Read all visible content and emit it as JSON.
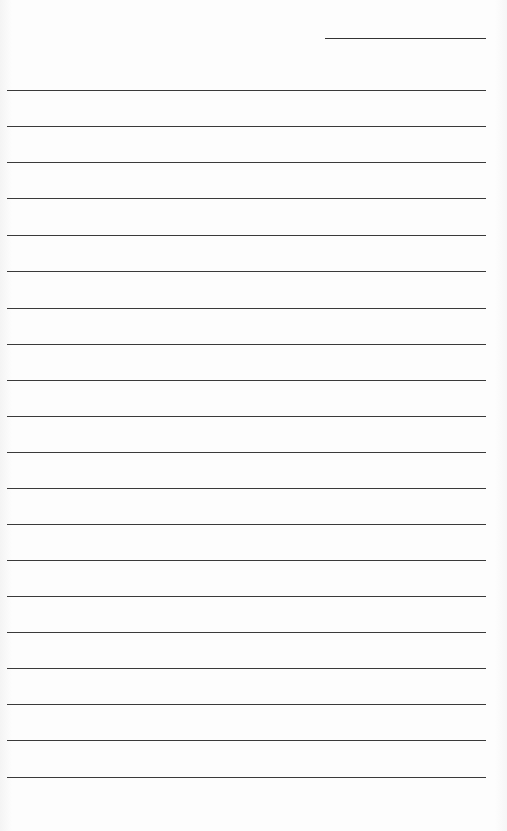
{
  "document": {
    "type": "lined-paper",
    "header_line": {
      "x": 325,
      "y": 38,
      "width": 161
    },
    "rules": {
      "count": 20,
      "x": 7,
      "width": 479,
      "positions": [
        90,
        126,
        162,
        198,
        235,
        271,
        308,
        344,
        380,
        416,
        452,
        488,
        524,
        560,
        596,
        632,
        668,
        704,
        740,
        777
      ]
    },
    "line_color": "#3a3a3a",
    "background_color": "#fdfdfd"
  }
}
